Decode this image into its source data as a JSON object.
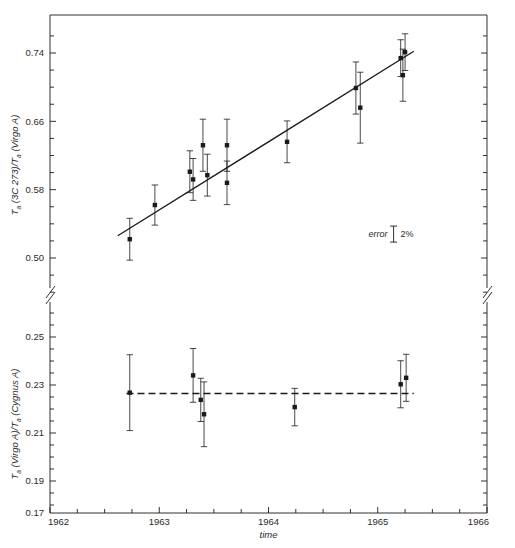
{
  "figure": {
    "background": "#ffffff",
    "ink": "#1a1a1a",
    "plot": {
      "left": 50,
      "right": 487,
      "top": 15,
      "bottom": 513
    }
  },
  "chart_data": {
    "type": "scatter",
    "title": "",
    "xlabel": "time",
    "x": {
      "min": 1962,
      "max": 1966,
      "ticks": [
        1962,
        1963,
        1964,
        1965,
        1966
      ],
      "tick_labels": [
        "1962",
        "1963",
        "1964",
        "1965",
        "1966"
      ],
      "minor_tick_step": 0.25
    },
    "panels": [
      {
        "id": "upper",
        "ylabel_parts": {
          "t": "T",
          "sub1": "a",
          "mid": " (3C 273)/",
          "t2": "T",
          "sub2": "a",
          "end": " (Virgo A)"
        },
        "ylabel": "T_a (3C 273)/T_a (Virgo A)",
        "ylim": [
          0.46,
          0.775
        ],
        "yticks": [
          0.5,
          0.58,
          0.66,
          0.74
        ],
        "ytick_labels": [
          "0.50",
          "0.58",
          "0.66",
          "0.74"
        ],
        "minor_tick_step": 0.02,
        "pixel_anchors": {
          "y_0p74": 53,
          "y_0p66": 121,
          "y_0p58": 190,
          "y_0p50": 258,
          "bottom": 295
        },
        "fit_line": {
          "style": "solid",
          "x1": 1962.62,
          "y1": 0.526,
          "x2": 1965.33,
          "y2": 0.742
        },
        "points": [
          {
            "x": 1962.73,
            "y": 0.522,
            "err": 0.0245
          },
          {
            "x": 1962.96,
            "y": 0.562,
            "err": 0.0235
          },
          {
            "x": 1963.28,
            "y": 0.601,
            "err": 0.0245
          },
          {
            "x": 1963.31,
            "y": 0.592,
            "err": 0.0245
          },
          {
            "x": 1963.4,
            "y": 0.632,
            "err": 0.0305
          },
          {
            "x": 1963.44,
            "y": 0.597,
            "err": 0.0245
          },
          {
            "x": 1963.62,
            "y": 0.632,
            "err": 0.0305
          },
          {
            "x": 1963.62,
            "y": 0.588,
            "err": 0.0255
          },
          {
            "x": 1964.17,
            "y": 0.636,
            "err": 0.0245
          },
          {
            "x": 1964.8,
            "y": 0.699,
            "err": 0.0305
          },
          {
            "x": 1964.84,
            "y": 0.676,
            "err": 0.0415
          },
          {
            "x": 1965.21,
            "y": 0.734,
            "err": 0.0215
          },
          {
            "x": 1965.25,
            "y": 0.741,
            "err": 0.0215
          },
          {
            "x": 1965.23,
            "y": 0.714,
            "err": 0.0305
          }
        ],
        "annotation": {
          "text_italic": "error",
          "text_plain": "2%",
          "x": 1965.2,
          "y": 0.528
        }
      },
      {
        "id": "lower",
        "ylabel_parts": {
          "t": "T",
          "sub1": "a",
          "mid": " (Virgo A)/",
          "t2": "T",
          "sub2": "a",
          "end": " (Cygnus A)"
        },
        "ylabel": "T_a (Virgo A)/T_a (Cygnus A)",
        "ylim": [
          0.17,
          0.262
        ],
        "yticks": [
          0.19,
          0.21,
          0.23,
          0.25
        ],
        "ytick_labels": [
          "0.19",
          "0.21",
          "0.23",
          "0.25"
        ],
        "extra_tick_label": "0.17",
        "minor_tick_step": 0.005,
        "pixel_anchors": {
          "y_0p25": 337,
          "y_0p23": 385,
          "y_0p21": 433,
          "y_0p19": 481,
          "bottom": 513
        },
        "fit_line": {
          "style": "dashed",
          "x1": 1962.7,
          "y1": 0.2265,
          "x2": 1965.33,
          "y2": 0.2265
        },
        "points": [
          {
            "x": 1962.73,
            "y": 0.2268,
            "err": 0.0158
          },
          {
            "x": 1963.31,
            "y": 0.234,
            "err": 0.0112
          },
          {
            "x": 1963.38,
            "y": 0.2238,
            "err": 0.009
          },
          {
            "x": 1963.41,
            "y": 0.2178,
            "err": 0.0135
          },
          {
            "x": 1964.24,
            "y": 0.2208,
            "err": 0.0078
          },
          {
            "x": 1965.21,
            "y": 0.2303,
            "err": 0.0098
          },
          {
            "x": 1965.26,
            "y": 0.233,
            "err": 0.0098
          }
        ]
      }
    ],
    "axis_break": {
      "present": true,
      "y": 295,
      "sides": [
        "left",
        "right"
      ]
    },
    "grid": false,
    "legend": false
  }
}
